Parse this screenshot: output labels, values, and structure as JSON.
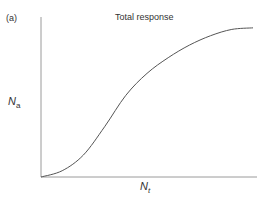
{
  "panel_label": "(a)",
  "chart_data": {
    "type": "line",
    "title": "Total response",
    "xlabel": "N_t",
    "ylabel": "N_a",
    "xlabel_main": "N",
    "xlabel_sub": "t",
    "ylabel_main": "N",
    "ylabel_sub": "a",
    "grid": false,
    "legend": null,
    "series": [
      {
        "name": "Total response",
        "shape": "sigmoid",
        "x": [
          0,
          0.1,
          0.2,
          0.3,
          0.4,
          0.5,
          0.6,
          0.7,
          0.8,
          0.9,
          1.0
        ],
        "y": [
          0,
          0.04,
          0.14,
          0.32,
          0.52,
          0.66,
          0.76,
          0.84,
          0.9,
          0.94,
          0.95
        ]
      }
    ],
    "xlim": [
      0,
      1
    ],
    "ylim": [
      0,
      1
    ]
  }
}
